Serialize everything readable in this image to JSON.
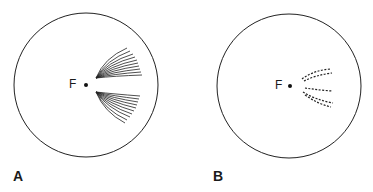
{
  "panels": [
    {
      "id": "A",
      "label": "A",
      "focus_label": "F",
      "pattern": "continuous curved lines diverging from focus"
    },
    {
      "id": "B",
      "label": "B",
      "focus_label": "F",
      "pattern": "fragmented dashed traces diverging from focus"
    }
  ],
  "colors": {
    "stroke": "#1a1a1a",
    "background": "#ffffff"
  }
}
